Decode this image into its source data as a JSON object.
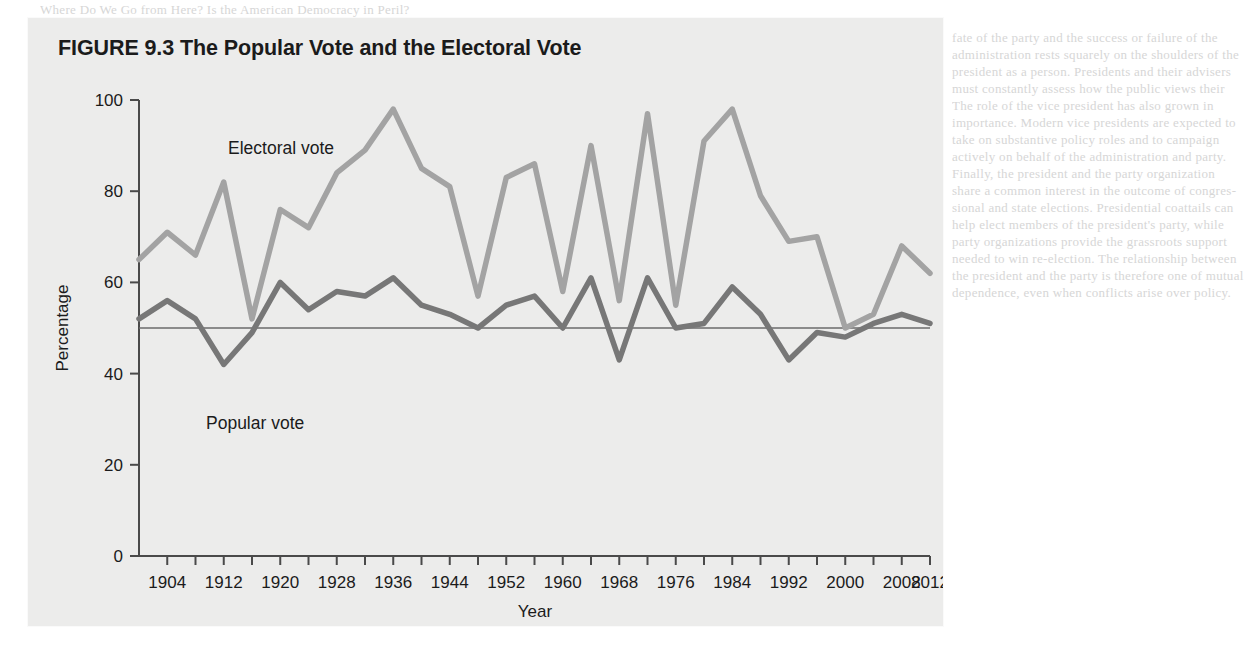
{
  "figure": {
    "number_label": "FIGURE 9.3",
    "title": "The Popular Vote and the Electoral Vote",
    "full_title": "FIGURE 9.3 The Popular Vote and the Electoral Vote",
    "panel_background": "#ececeb"
  },
  "labels": {
    "electoral_series": "Electoral vote",
    "popular_series": "Popular vote",
    "x_axis": "Year",
    "y_axis": "Percentage"
  },
  "background_page_text": [
    "Where Do We Go from Here? Is the American Democracy in Peril?",
    "that the president speaks for the whole nation, the",
    "fate of the party and the success or failure of the",
    "administration rests squarely on the shoulders of the",
    "president as a person. Presidents and their advisers",
    "must constantly assess how the public views their",
    "The role of the vice president has also grown in",
    "importance. Modern vice presidents are expected to",
    "take on substantive policy roles and to campaign",
    "actively on behalf of the administration and party.",
    "Finally, the president and the party organization",
    "share a common interest in the outcome of congres-",
    "sional and state elections. Presidential coattails can",
    "help elect members of the president's party, while",
    "party organizations provide the grassroots support",
    "needed to win re-election. The relationship between",
    "the president and the party is therefore one of mutual",
    "dependence, even when conflicts arise over policy."
  ],
  "chart_data": {
    "type": "line",
    "title": "The Popular Vote and the Electoral Vote",
    "xlabel": "Year",
    "ylabel": "Percentage",
    "xlim": [
      1900,
      2012
    ],
    "ylim": [
      0,
      100
    ],
    "y_ticks": [
      0,
      20,
      40,
      60,
      80,
      100
    ],
    "x_ticks_major": [
      1904,
      1912,
      1920,
      1928,
      1936,
      1944,
      1952,
      1960,
      1968,
      1976,
      1984,
      1992,
      2000,
      2008,
      2012
    ],
    "x_ticks_minor_step": 4,
    "grid": false,
    "reference_line": {
      "value": 50,
      "label": "50 percent",
      "color": "#6b6b6b"
    },
    "legend_position": "inline-annotation",
    "colors": {
      "electoral": "#a3a3a3",
      "popular": "#777777",
      "axis": "#4a4a4a"
    },
    "x": [
      1900,
      1904,
      1908,
      1912,
      1916,
      1920,
      1924,
      1928,
      1932,
      1936,
      1940,
      1944,
      1948,
      1952,
      1956,
      1960,
      1964,
      1968,
      1972,
      1976,
      1980,
      1984,
      1988,
      1992,
      1996,
      2000,
      2004,
      2008,
      2012
    ],
    "series": [
      {
        "name": "Electoral vote",
        "color": "#a3a3a3",
        "values": [
          65,
          71,
          66,
          82,
          52,
          76,
          72,
          84,
          89,
          98,
          85,
          81,
          57,
          83,
          86,
          58,
          90,
          56,
          97,
          55,
          91,
          98,
          79,
          69,
          70,
          50,
          53,
          68,
          62
        ]
      },
      {
        "name": "Popular vote",
        "color": "#777777",
        "values": [
          52,
          56,
          52,
          42,
          49,
          60,
          54,
          58,
          57,
          61,
          55,
          53,
          50,
          55,
          57,
          50,
          61,
          43,
          61,
          50,
          51,
          59,
          53,
          43,
          49,
          48,
          51,
          53,
          51
        ]
      }
    ]
  }
}
